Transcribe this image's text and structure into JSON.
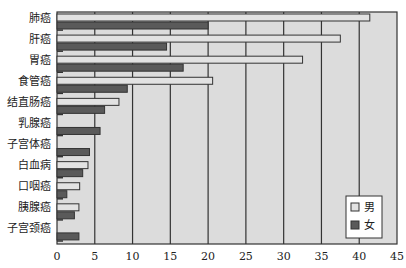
{
  "chart_data": {
    "type": "bar",
    "orientation": "horizontal",
    "title": "",
    "xlabel": "",
    "ylabel": "",
    "xlim": [
      0,
      45
    ],
    "x_ticks": [
      0,
      5,
      10,
      15,
      20,
      25,
      30,
      35,
      40,
      45
    ],
    "grid": "vertical",
    "categories": [
      "肺癌",
      "肝癌",
      "胃癌",
      "食管癌",
      "结直肠癌",
      "乳腺癌",
      "子宫体癌",
      "白血病",
      "口咽癌",
      "胰腺癌",
      "子宫颈癌"
    ],
    "series": [
      {
        "name": "男",
        "color": "#e2e2e2",
        "values": [
          41.4,
          37.5,
          32.5,
          20.6,
          8.2,
          null,
          null,
          4.1,
          3.0,
          2.9,
          null
        ]
      },
      {
        "name": "女",
        "color": "#5a5a5a",
        "values": [
          20.0,
          14.5,
          16.7,
          9.3,
          6.3,
          5.7,
          4.3,
          3.4,
          1.3,
          2.3,
          2.9
        ]
      }
    ],
    "legend": {
      "position": "bottom-right",
      "entries": [
        "男",
        "女"
      ]
    },
    "colors": {
      "plot_background": "#dcdcdc",
      "axis": "#333333",
      "gridline": "#333333"
    }
  }
}
